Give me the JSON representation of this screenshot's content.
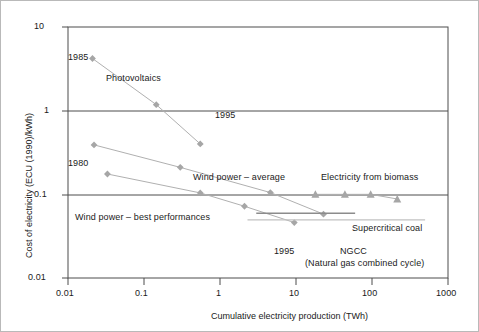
{
  "chart_data": {
    "type": "line",
    "title": "",
    "xlabel": "Cumulative electricity production (TWh)",
    "ylabel": "Cost of electricity (ECU (1990)/kWh)",
    "xscale": "log",
    "yscale": "log",
    "xlim": [
      0.01,
      1000
    ],
    "ylim": [
      0.01,
      10
    ],
    "xticks": [
      "0.01",
      "0.1",
      "1",
      "10",
      "100",
      "1000"
    ],
    "xtick_values": [
      0.01,
      0.1,
      1,
      10,
      100,
      1000
    ],
    "yticks": [
      "10",
      "1",
      "0.1",
      "0.01"
    ],
    "ytick_values": [
      10,
      1,
      0.1,
      0.01
    ],
    "grid": false,
    "legend": "inline-annotations",
    "series": [
      {
        "name": "Photovoltaics",
        "marker": "diamond",
        "color": "#a6a6a6",
        "points": [
          {
            "x": 0.021,
            "y": 4.2
          },
          {
            "x": 0.145,
            "y": 1.18
          },
          {
            "x": 0.55,
            "y": 0.4
          }
        ],
        "start_label": "1985",
        "end_label": "1995"
      },
      {
        "name": "Wind power - average",
        "marker": "diamond",
        "color": "#a6a6a6",
        "points": [
          {
            "x": 0.022,
            "y": 0.39
          },
          {
            "x": 0.3,
            "y": 0.21
          },
          {
            "x": 4.6,
            "y": 0.105
          },
          {
            "x": 23.0,
            "y": 0.058
          }
        ]
      },
      {
        "name": "Wind power - best performances",
        "marker": "diamond",
        "color": "#a6a6a6",
        "points": [
          {
            "x": 0.033,
            "y": 0.175
          },
          {
            "x": 0.55,
            "y": 0.104
          },
          {
            "x": 2.1,
            "y": 0.072
          },
          {
            "x": 9.5,
            "y": 0.046
          }
        ],
        "start_label": "1980",
        "end_label": "1995"
      },
      {
        "name": "Electricity from biomass",
        "marker": "triangle",
        "color": "#a6a6a6",
        "points": [
          {
            "x": 18.0,
            "y": 0.1
          },
          {
            "x": 44.0,
            "y": 0.1
          },
          {
            "x": 96.0,
            "y": 0.1
          },
          {
            "x": 215.0,
            "y": 0.088
          }
        ]
      },
      {
        "name": "Supercritical coal",
        "marker": "none",
        "color": "#8c8c8c",
        "type": "hline",
        "y": 0.0595,
        "x_start": 3.0,
        "x_end": 60.0
      },
      {
        "name": "NGCC",
        "marker": "none",
        "color": "#c2c2c2",
        "type": "hline",
        "y": 0.0495,
        "x_start": 2.3,
        "x_end": 500.0
      }
    ],
    "annotations": [
      {
        "id": "pv-start-year",
        "text": "1985",
        "x_px": 68,
        "y_px": 52
      },
      {
        "id": "pv-series-label",
        "text": "Photovoltaics",
        "x_px": 106,
        "y_px": 73
      },
      {
        "id": "pv-end-year",
        "text": "1995",
        "x_px": 215,
        "y_px": 110
      },
      {
        "id": "wind-best-start-year",
        "text": "1980",
        "x_px": 68,
        "y_px": 158
      },
      {
        "id": "wind-average-label",
        "text": "Wind power – average",
        "x_px": 193,
        "y_px": 172
      },
      {
        "id": "biomass-label",
        "text": "Electricity from biomass",
        "x_px": 321,
        "y_px": 172
      },
      {
        "id": "wind-best-label",
        "text": "Wind power – best performances",
        "x_px": 75,
        "y_px": 212
      },
      {
        "id": "supercritical-coal-label",
        "text": "Supercritical coal",
        "x_px": 352,
        "y_px": 223
      },
      {
        "id": "wind-best-end-year",
        "text": "1995",
        "x_px": 274,
        "y_px": 246
      },
      {
        "id": "ngcc-label",
        "text": "NGCC",
        "x_px": 340,
        "y_px": 246
      },
      {
        "id": "ngcc-sublabel",
        "text": "(Natural gas combined cycle)",
        "x_px": 305,
        "y_px": 258
      }
    ],
    "colors": {
      "marker": "#a6a6a6",
      "line": "#b0b0b0",
      "axis": "#4d4d4d",
      "text": "#1a1a1a",
      "background": "#ffffff",
      "border": "#b9b9b9",
      "coal_line": "#8c8c8c",
      "ngcc_line": "#c2c2c2"
    }
  },
  "geometry": {
    "plot_left": 68,
    "plot_right": 448,
    "plot_top": 27,
    "plot_bottom": 278
  }
}
